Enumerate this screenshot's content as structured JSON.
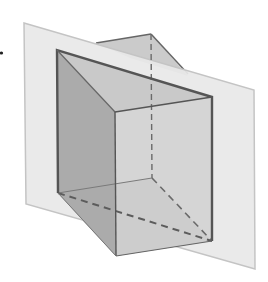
{
  "diagram": {
    "colors": {
      "background": "#ffffff",
      "plane": "#e8e8e8",
      "plane_edge": "#c4c4c4",
      "left_face": "#a9a9a9",
      "top_face": "#c9c9c9",
      "front_face": "#d2d2d2",
      "bottom_face": "#9b9b9b",
      "back_face": "#cdcdcd",
      "edge": "#555555",
      "hidden_edge": "#666666"
    },
    "vertices": {
      "A_top_left": [
        57,
        50
      ],
      "B_top_back": [
        151,
        34
      ],
      "C_top_front_right": [
        212,
        97
      ],
      "D_front_top_left": [
        115,
        112
      ],
      "E_bottom_left": [
        58,
        193
      ],
      "F_bottom_back": [
        152,
        178
      ],
      "G_bottom_front_right": [
        212,
        241
      ],
      "H_front_bottom_left": [
        116,
        256
      ]
    },
    "plane_corners": [
      [
        24,
        23
      ],
      [
        254,
        90
      ],
      [
        255,
        269
      ],
      [
        26,
        204
      ]
    ],
    "marker_dot": [
      1,
      53
    ]
  }
}
